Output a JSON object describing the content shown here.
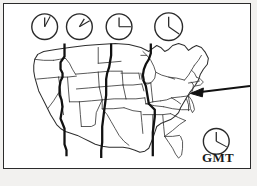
{
  "figure": {
    "title": "United States time zone map with clocks",
    "bottom_caption": "",
    "frame_color": "#2b2b2b",
    "background_color": "#ffffff",
    "page_background_color": "#f2f1ef",
    "line_color": "#1a1a1a"
  },
  "gmt": {
    "label": "GMT"
  },
  "clocks": [
    {
      "name": "clock-pacific",
      "cx": 41,
      "cy": 23,
      "r": 13,
      "hour_angle": 0,
      "minute_angle": 28,
      "reading": "12:05"
    },
    {
      "name": "clock-mountain",
      "cx": 76,
      "cy": 23,
      "r": 13,
      "hour_angle": 32,
      "minute_angle": 60,
      "reading": "1:10"
    },
    {
      "name": "clock-central",
      "cx": 116,
      "cy": 23,
      "r": 13,
      "hour_angle": 0,
      "minute_angle": 90,
      "reading": "12:15"
    },
    {
      "name": "clock-eastern",
      "cx": 166,
      "cy": 23,
      "r": 14,
      "hour_angle": 0,
      "minute_angle": 125,
      "reading": "12:21"
    },
    {
      "name": "clock-gmt",
      "cx": 214,
      "cy": 139,
      "r": 13,
      "hour_angle": 0,
      "minute_angle": 118,
      "reading": "12:20"
    }
  ],
  "map": {
    "region": "Continental United States",
    "state_outline_color": "#3a3a3a",
    "timezone_boundary_color": "#111111",
    "timezone_boundaries": [
      {
        "name": "pacific-mountain-boundary"
      },
      {
        "name": "mountain-central-boundary"
      },
      {
        "name": "central-eastern-boundary"
      }
    ],
    "pointer": {
      "name": "mid-atlantic-pointer",
      "description": "arrow pointing to mid-atlantic region"
    }
  }
}
